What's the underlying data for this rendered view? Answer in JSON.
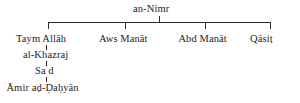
{
  "diagram": {
    "type": "genealogical-tree",
    "title_node": {
      "label": "an-Nimr"
    },
    "children": [
      {
        "label": "Taym Allāh"
      },
      {
        "label": "Aws Manāt"
      },
      {
        "label": "ʿAbd Manāt",
        "prefix": "ʿ",
        "rest": "Abd Manāt"
      },
      {
        "label": "Qāsiṭ"
      }
    ],
    "descent_chain": [
      {
        "label": "al-Khazraj"
      },
      {
        "label": "Saʿd",
        "part1": "Sa",
        "sup": "ʿ",
        "part2": "d"
      },
      {
        "label": "ʿĀmir aḍ-Ḍaḥyān",
        "prefix": "ʿ",
        "rest": "Āmir aḍ-Ḍaḥyān"
      }
    ],
    "colors": {
      "line": "#2b2b2b",
      "text": "#1d1d1d",
      "background": "#ffffff"
    }
  }
}
